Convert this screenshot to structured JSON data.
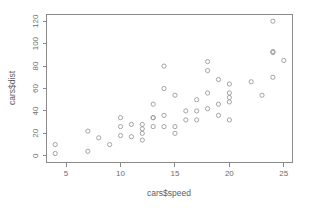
{
  "chart_data": {
    "type": "scatter",
    "title": "",
    "xlabel": "cars$speed",
    "ylabel": "cars$dist",
    "xlim": [
      3.2,
      25.8
    ],
    "ylim": [
      -6,
      126
    ],
    "xticks": [
      5,
      10,
      15,
      20,
      25
    ],
    "yticks": [
      0,
      20,
      40,
      60,
      80,
      100,
      120
    ],
    "xtick_labels": [
      "5",
      "10",
      "15",
      "20",
      "25"
    ],
    "ytick_labels": [
      "0",
      "20",
      "40",
      "60",
      "80",
      "100",
      "120"
    ],
    "grid": false,
    "legend": false,
    "marker": "open-circle",
    "marker_color": "#9a9a9a",
    "background": "#ffffff",
    "frame": "box",
    "n_points": 50,
    "x": [
      4,
      4,
      7,
      7,
      8,
      9,
      10,
      10,
      10,
      11,
      11,
      12,
      12,
      12,
      12,
      13,
      13,
      13,
      13,
      14,
      14,
      14,
      14,
      15,
      15,
      15,
      16,
      16,
      17,
      17,
      17,
      18,
      18,
      18,
      18,
      19,
      19,
      19,
      20,
      20,
      20,
      20,
      20,
      22,
      23,
      24,
      24,
      24,
      24,
      25
    ],
    "y": [
      2,
      10,
      4,
      22,
      16,
      10,
      18,
      26,
      34,
      17,
      28,
      14,
      20,
      24,
      28,
      26,
      34,
      34,
      46,
      26,
      36,
      60,
      80,
      20,
      26,
      54,
      32,
      40,
      32,
      40,
      50,
      42,
      56,
      76,
      84,
      36,
      46,
      68,
      32,
      48,
      52,
      56,
      64,
      66,
      54,
      70,
      92,
      93,
      120,
      85
    ]
  },
  "axes": {
    "x_title": "cars$speed",
    "y_title": "cars$dist"
  }
}
